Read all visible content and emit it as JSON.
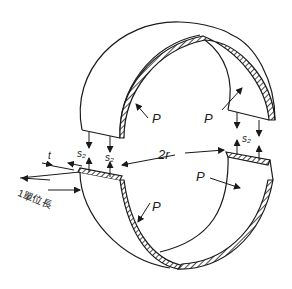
{
  "diagram": {
    "labels": {
      "p_top_left": "P",
      "p_top_right": "P",
      "p_bottom_right": "P",
      "p_bottom_left": "P",
      "s2_left_outer": "s₂",
      "s2_left_inner": "s₂",
      "s2_right": "s₂",
      "diameter": "2r",
      "thickness": "t",
      "unit_length": "1單位長"
    },
    "colors": {
      "line": "#1a1a1a",
      "background": "#ffffff"
    }
  }
}
